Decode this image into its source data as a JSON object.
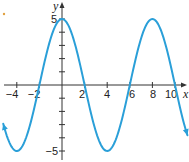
{
  "chart_data": {
    "type": "line",
    "title": "",
    "xlabel": "x",
    "ylabel": "y",
    "xlim": [
      -5.5,
      11.2
    ],
    "ylim": [
      -5.5,
      5.8
    ],
    "grid": false,
    "x_ticks": [
      -4,
      -2,
      2,
      4,
      6,
      8,
      10
    ],
    "x_tick_labels": [
      "−4",
      "−2",
      "2",
      "4",
      "6",
      "8",
      "10"
    ],
    "y_ticks": [
      -5,
      -4,
      -3,
      -2,
      -1,
      1,
      2,
      3,
      4,
      5
    ],
    "y_tick_labels_shown": {
      "5": "5",
      "-5": "−5"
    },
    "series": [
      {
        "name": "curve",
        "color": "#2a9fd8",
        "function": "y = 5 cos(pi x / 4)",
        "amplitude": 5,
        "period": 8,
        "x": [
          -5.5,
          -4,
          -2,
          0,
          2,
          4,
          6,
          8,
          10,
          11.2
        ],
        "values": [
          -3.54,
          -5,
          0,
          5,
          0,
          -5,
          0,
          5,
          0,
          -4.05
        ],
        "arrows": "both ends"
      }
    ]
  },
  "labels": {
    "x_axis": "x",
    "y_axis": "y",
    "y_top": "5",
    "y_bottom": "−5",
    "xt_m4": "−4",
    "xt_m2": "−2",
    "xt_2": "2",
    "xt_4": "4",
    "xt_6": "6",
    "xt_8": "8",
    "xt_10": "10"
  },
  "colors": {
    "curve": "#2a9fd8",
    "axis": "#333333",
    "marker": "#e0a040"
  }
}
